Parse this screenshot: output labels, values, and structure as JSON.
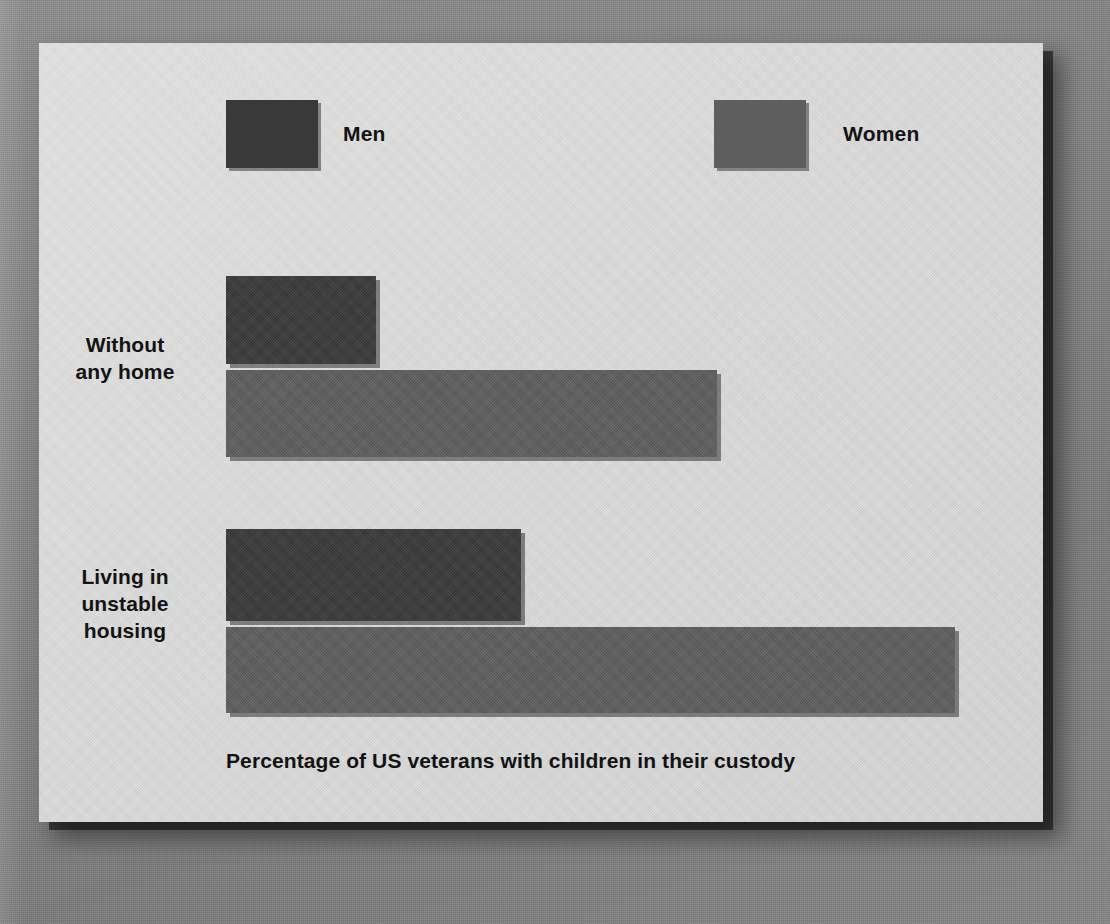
{
  "figure": {
    "caption": "Percentage of US veterans with children in their custody",
    "background_color": "#838383",
    "card_color": "#d9d9d9",
    "text_color": "#131313"
  },
  "legend": {
    "items": [
      {
        "label": "Men",
        "color": "#393939"
      },
      {
        "label": "Women",
        "color": "#5e5e5e"
      }
    ]
  },
  "chart_data": {
    "type": "bar",
    "orientation": "horizontal",
    "title": "",
    "xlabel": "Percentage of US veterans with children in their custody",
    "ylabel": "",
    "grid": false,
    "legend_position": "top",
    "categories": [
      "Without any home",
      "Living in unstable housing"
    ],
    "category_lines": [
      [
        "Without",
        "any home"
      ],
      [
        "Living in",
        "unstable",
        "housing"
      ]
    ],
    "series": [
      {
        "name": "Men",
        "color": "#393939",
        "values": [
          15.0,
          29.5
        ]
      },
      {
        "name": "Women",
        "color": "#5e5e5e",
        "values": [
          49.1,
          72.9
        ]
      }
    ],
    "xlim": [
      0,
      100
    ],
    "bar_pixel_lengths": {
      "Men": [
        150,
        295
      ],
      "Women": [
        491,
        729
      ]
    },
    "axis_ticks_visible": false,
    "value_labels_visible": false
  }
}
